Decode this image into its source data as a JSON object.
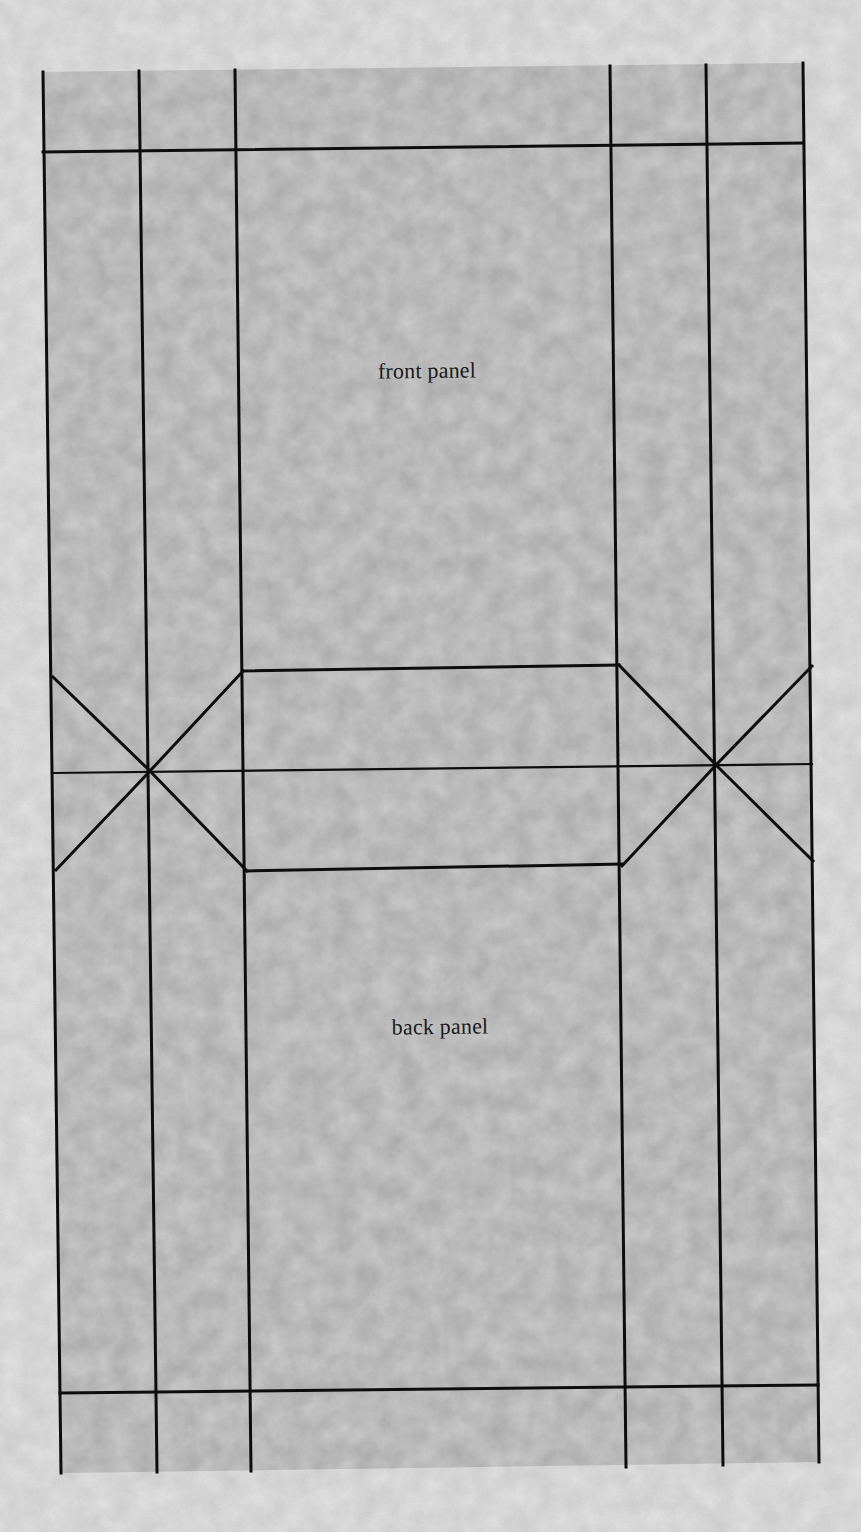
{
  "diagram": {
    "type": "box-net-template",
    "colors": {
      "margin": "#d2d2d2",
      "panel_fill": "#a9a9a9",
      "line": "#0d0d0d"
    },
    "labels": [
      {
        "id": "front_panel",
        "text": "front panel",
        "x": 427,
        "y": 371
      },
      {
        "id": "back_panel",
        "text": "back panel",
        "x": 440,
        "y": 1027
      }
    ],
    "outline": [
      [
        43,
        72
      ],
      [
        803,
        63
      ],
      [
        819,
        1462
      ],
      [
        61,
        1473
      ]
    ],
    "vertical_lines": [
      {
        "id": "left-edge",
        "top": [
          43,
          72
        ],
        "bottom": [
          61,
          1473
        ]
      },
      {
        "id": "left-glue-flap",
        "top": [
          139,
          71
        ],
        "bottom": [
          157,
          1472
        ]
      },
      {
        "id": "left-side-panel",
        "top": [
          235,
          70
        ],
        "bottom": [
          251,
          1471
        ]
      },
      {
        "id": "right-side-panel",
        "top": [
          610,
          66
        ],
        "bottom": [
          626,
          1467
        ]
      },
      {
        "id": "right-glue-flap",
        "top": [
          706,
          65
        ],
        "bottom": [
          723,
          1465
        ]
      },
      {
        "id": "right-edge",
        "top": [
          803,
          63
        ],
        "bottom": [
          819,
          1462
        ]
      }
    ],
    "horizontal_lines": [
      {
        "id": "top-tuck-fold",
        "left": [
          43,
          152
        ],
        "right": [
          803,
          143
        ]
      },
      {
        "id": "center-fold",
        "left": [
          54,
          773
        ],
        "right": [
          812,
          764
        ]
      },
      {
        "id": "bottom-tuck-fold",
        "left": [
          60,
          1393
        ],
        "right": [
          818,
          1385
        ]
      },
      {
        "id": "octagon-top",
        "left": [
          243,
          671
        ],
        "right": [
          619,
          665
        ]
      },
      {
        "id": "octagon-bottom",
        "left": [
          247,
          871
        ],
        "right": [
          622,
          864
        ]
      }
    ],
    "diagonal_lines": [
      {
        "id": "left-x-upper-outer",
        "from": [
          53,
          677
        ],
        "to": [
          150,
          771
        ]
      },
      {
        "id": "left-x-lower-outer",
        "from": [
          56,
          870
        ],
        "to": [
          150,
          771
        ]
      },
      {
        "id": "left-x-upper-inner",
        "from": [
          243,
          671
        ],
        "to": [
          150,
          771
        ]
      },
      {
        "id": "left-x-lower-inner",
        "from": [
          247,
          871
        ],
        "to": [
          150,
          771
        ]
      },
      {
        "id": "right-x-upper-inner",
        "from": [
          619,
          665
        ],
        "to": [
          716,
          765
        ]
      },
      {
        "id": "right-x-lower-inner",
        "from": [
          622,
          866
        ],
        "to": [
          716,
          765
        ]
      },
      {
        "id": "right-x-upper-outer",
        "from": [
          812,
          666
        ],
        "to": [
          716,
          765
        ]
      },
      {
        "id": "right-x-lower-outer",
        "from": [
          813,
          861
        ],
        "to": [
          716,
          765
        ]
      }
    ]
  }
}
